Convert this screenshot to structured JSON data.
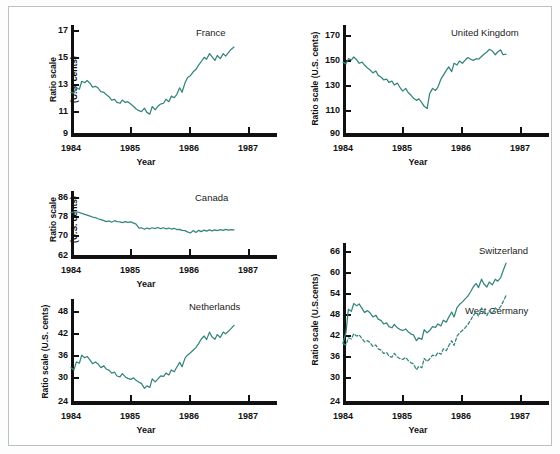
{
  "figure": {
    "background": "#ffffff",
    "line_color": "#35847c",
    "axis_color": "#111111"
  },
  "charts": [
    {
      "id": "france",
      "type": "line",
      "title": "France",
      "ylabel_line1": "Ratio scale",
      "ylabel_line2": "(U.S. cents)",
      "ylabel": "Ratio scale (U.S. cents)",
      "xlabel": "Year",
      "yticks": [
        "17",
        "15",
        "13",
        "11",
        "9"
      ],
      "ytick_values": [
        17,
        15,
        13,
        11,
        9
      ],
      "xticks": [
        "1984",
        "1985",
        "1986",
        "1987"
      ],
      "xtick_values": [
        1984,
        1985,
        1986,
        1987
      ],
      "ylim": [
        9,
        17
      ],
      "xlim": [
        1984,
        1987.45
      ],
      "scale": "log",
      "series": [
        {
          "name": "France",
          "style": "solid",
          "x": [
            1984.0,
            1984.05,
            1984.09,
            1984.14,
            1984.18,
            1984.23,
            1984.27,
            1984.32,
            1984.36,
            1984.41,
            1984.45,
            1984.5,
            1984.55,
            1984.59,
            1984.64,
            1984.68,
            1984.73,
            1984.77,
            1984.82,
            1984.86,
            1984.91,
            1984.95,
            1985.0,
            1985.05,
            1985.09,
            1985.14,
            1985.18,
            1985.23,
            1985.27,
            1985.32,
            1985.36,
            1985.41,
            1985.45,
            1985.5,
            1985.55,
            1985.59,
            1985.64,
            1985.68,
            1985.73,
            1985.77,
            1985.82,
            1985.86,
            1985.91,
            1985.95,
            1986.0,
            1986.05,
            1986.09,
            1986.14,
            1986.18,
            1986.23,
            1986.27,
            1986.32,
            1986.36,
            1986.41,
            1986.45,
            1986.5,
            1986.55,
            1986.59,
            1986.64,
            1986.68,
            1986.73
          ],
          "y": [
            11.6,
            11.55,
            11.9,
            11.8,
            12.35,
            12.25,
            12.4,
            12.2,
            11.95,
            12.0,
            11.9,
            11.65,
            11.6,
            11.45,
            11.3,
            11.1,
            11.15,
            10.95,
            10.9,
            11.1,
            10.95,
            11.0,
            10.85,
            10.7,
            10.55,
            10.45,
            10.4,
            10.6,
            10.35,
            10.25,
            10.7,
            10.5,
            10.7,
            10.85,
            10.9,
            11.15,
            11.0,
            11.35,
            11.25,
            11.45,
            11.9,
            11.6,
            12.25,
            12.6,
            12.75,
            13.05,
            13.2,
            13.55,
            13.8,
            14.15,
            14.0,
            14.45,
            14.2,
            13.9,
            14.3,
            14.05,
            14.45,
            14.25,
            14.55,
            14.8,
            15.0
          ]
        }
      ]
    },
    {
      "id": "united-kingdom",
      "type": "line",
      "title": "United Kingdom",
      "ylabel": "Ratio scale (U.S. cents)",
      "xlabel": "Year",
      "yticks": [
        "170",
        "150",
        "130",
        "110",
        "90"
      ],
      "ytick_values": [
        170,
        150,
        130,
        110,
        90
      ],
      "xticks": [
        "1984",
        "1985",
        "1986",
        "1987"
      ],
      "xtick_values": [
        1984,
        1985,
        1986,
        1987
      ],
      "ylim": [
        90,
        178
      ],
      "xlim": [
        1984,
        1987.45
      ],
      "scale": "log",
      "series": [
        {
          "name": "United Kingdom",
          "style": "solid",
          "x": [
            1984.0,
            1984.05,
            1984.09,
            1984.14,
            1984.18,
            1984.23,
            1984.27,
            1984.32,
            1984.36,
            1984.41,
            1984.45,
            1984.5,
            1984.55,
            1984.59,
            1984.64,
            1984.68,
            1984.73,
            1984.77,
            1984.82,
            1984.86,
            1984.91,
            1984.95,
            1985.0,
            1985.05,
            1985.09,
            1985.14,
            1985.18,
            1985.23,
            1985.27,
            1985.32,
            1985.36,
            1985.41,
            1985.45,
            1985.5,
            1985.55,
            1985.59,
            1985.64,
            1985.68,
            1985.73,
            1985.77,
            1985.82,
            1985.86,
            1985.91,
            1985.95,
            1986.0,
            1986.05,
            1986.09,
            1986.14,
            1986.18,
            1986.23,
            1986.27,
            1986.32,
            1986.36,
            1986.41,
            1986.45,
            1986.5,
            1986.55,
            1986.59,
            1986.64,
            1986.68,
            1986.73
          ],
          "y": [
            142.0,
            140.5,
            145.0,
            144.0,
            146.5,
            144.0,
            141.0,
            142.0,
            139.5,
            137.0,
            135.5,
            133.0,
            134.5,
            131.0,
            129.5,
            127.5,
            128.0,
            125.5,
            126.5,
            123.5,
            125.0,
            122.0,
            119.0,
            121.0,
            118.0,
            116.0,
            114.0,
            112.5,
            113.5,
            111.0,
            108.5,
            107.0,
            117.0,
            121.0,
            119.5,
            122.0,
            128.0,
            131.0,
            135.0,
            138.0,
            134.0,
            141.0,
            139.5,
            143.0,
            141.0,
            144.0,
            146.0,
            144.5,
            143.5,
            145.0,
            144.5,
            147.0,
            149.0,
            151.0,
            153.5,
            152.0,
            148.5,
            151.0,
            153.0,
            148.5,
            149.0
          ]
        }
      ]
    },
    {
      "id": "canada",
      "type": "line",
      "title": "Canada",
      "ylabel_line1": "Ratio scale",
      "ylabel_line2": "(U.S. cents)",
      "ylabel": "Ratio scale (U.S. cents)",
      "xlabel": "Year",
      "yticks": [
        "86",
        "78",
        "70",
        "62"
      ],
      "ytick_values": [
        86,
        78,
        70,
        62
      ],
      "xticks": [
        "1984",
        "1985",
        "1986",
        "1987"
      ],
      "xtick_values": [
        1984,
        1985,
        1986,
        1987
      ],
      "ylim": [
        62,
        89
      ],
      "xlim": [
        1984,
        1987.45
      ],
      "scale": "log",
      "series": [
        {
          "name": "Canada",
          "style": "solid",
          "x": [
            1984.0,
            1984.05,
            1984.09,
            1984.14,
            1984.18,
            1984.23,
            1984.27,
            1984.32,
            1984.36,
            1984.41,
            1984.45,
            1984.5,
            1984.55,
            1984.59,
            1984.64,
            1984.68,
            1984.73,
            1984.77,
            1984.82,
            1984.86,
            1984.91,
            1984.95,
            1985.0,
            1985.05,
            1985.09,
            1985.14,
            1985.18,
            1985.23,
            1985.27,
            1985.32,
            1985.36,
            1985.41,
            1985.45,
            1985.5,
            1985.55,
            1985.59,
            1985.64,
            1985.68,
            1985.73,
            1985.77,
            1985.82,
            1985.86,
            1985.91,
            1985.95,
            1986.0,
            1986.05,
            1986.09,
            1986.14,
            1986.18,
            1986.23,
            1986.27,
            1986.32,
            1986.36,
            1986.41,
            1986.45,
            1986.5,
            1986.55,
            1986.59,
            1986.64,
            1986.68,
            1986.73
          ],
          "y": [
            79.3,
            79.6,
            79.6,
            79.4,
            79.0,
            78.6,
            78.3,
            77.9,
            77.5,
            77.3,
            76.8,
            76.4,
            76.0,
            75.6,
            75.9,
            75.4,
            76.0,
            75.6,
            75.5,
            75.2,
            75.6,
            75.3,
            75.5,
            75.0,
            74.6,
            73.1,
            73.2,
            72.6,
            73.1,
            72.8,
            73.2,
            72.9,
            73.3,
            72.9,
            73.2,
            72.8,
            73.1,
            72.7,
            73.0,
            72.5,
            72.6,
            72.2,
            72.1,
            71.6,
            71.2,
            72.1,
            71.4,
            72.2,
            71.7,
            72.3,
            71.9,
            72.4,
            72.0,
            72.4,
            72.1,
            72.5,
            72.2,
            72.6,
            72.3,
            72.5,
            72.4
          ]
        }
      ]
    },
    {
      "id": "netherlands",
      "type": "line",
      "title": "Netherlands",
      "ylabel": "Ratio scale (U.S. cents)",
      "xlabel": "Year",
      "yticks": [
        "48",
        "42",
        "36",
        "30",
        "24"
      ],
      "ytick_values": [
        48,
        42,
        36,
        30,
        24
      ],
      "xticks": [
        "1984",
        "1985",
        "1986",
        "1987"
      ],
      "xtick_values": [
        1984,
        1985,
        1986,
        1987
      ],
      "ylim": [
        24,
        51
      ],
      "xlim": [
        1984,
        1987.45
      ],
      "scale": "log",
      "series": [
        {
          "name": "Netherlands",
          "style": "solid",
          "x": [
            1984.0,
            1984.05,
            1984.09,
            1984.14,
            1984.18,
            1984.23,
            1984.27,
            1984.32,
            1984.36,
            1984.41,
            1984.45,
            1984.5,
            1984.55,
            1984.59,
            1984.64,
            1984.68,
            1984.73,
            1984.77,
            1984.82,
            1984.86,
            1984.91,
            1984.95,
            1985.0,
            1985.05,
            1985.09,
            1985.14,
            1985.18,
            1985.23,
            1985.27,
            1985.32,
            1985.36,
            1985.41,
            1985.45,
            1985.5,
            1985.55,
            1985.59,
            1985.64,
            1985.68,
            1985.73,
            1985.77,
            1985.82,
            1985.86,
            1985.91,
            1985.95,
            1986.0,
            1986.05,
            1986.09,
            1986.14,
            1986.18,
            1986.23,
            1986.27,
            1986.32,
            1986.36,
            1986.41,
            1986.45,
            1986.5,
            1986.55,
            1986.59,
            1986.64,
            1986.68,
            1986.73
          ],
          "y": [
            31.3,
            30.8,
            32.6,
            32.3,
            34.2,
            33.6,
            33.9,
            33.0,
            32.2,
            32.6,
            32.2,
            31.3,
            31.7,
            31.0,
            30.7,
            30.1,
            30.3,
            29.5,
            29.3,
            30.0,
            29.3,
            29.0,
            28.8,
            29.1,
            28.6,
            28.2,
            28.0,
            27.0,
            27.5,
            27.2,
            28.9,
            28.3,
            28.8,
            29.5,
            29.4,
            30.1,
            29.7,
            30.8,
            30.4,
            31.4,
            32.5,
            31.5,
            33.5,
            34.2,
            34.8,
            35.5,
            36.1,
            37.2,
            38.3,
            39.2,
            38.2,
            40.3,
            39.0,
            38.3,
            39.6,
            38.8,
            40.3,
            39.8,
            40.6,
            41.3,
            42.3
          ]
        }
      ]
    },
    {
      "id": "switzerland-west-germany",
      "type": "line",
      "title": "Switzerland / West Germany",
      "ylabel": "Ratio scale (U.S.cents)",
      "xlabel": "Year",
      "yticks": [
        "66",
        "60",
        "54",
        "48",
        "42",
        "36",
        "30",
        "24"
      ],
      "ytick_values": [
        66,
        60,
        54,
        48,
        42,
        36,
        30,
        24
      ],
      "xticks": [
        "1984",
        "1985",
        "1986",
        "1987"
      ],
      "xtick_values": [
        1984,
        1985,
        1986,
        1987
      ],
      "ylim": [
        24,
        69
      ],
      "xlim": [
        1984,
        1987.45
      ],
      "scale": "log",
      "legend": [
        "Switzerland",
        "West Germany"
      ],
      "series": [
        {
          "name": "Switzerland",
          "style": "solid",
          "x": [
            1984.0,
            1984.05,
            1984.09,
            1984.14,
            1984.18,
            1984.23,
            1984.27,
            1984.32,
            1984.36,
            1984.41,
            1984.45,
            1984.5,
            1984.55,
            1984.59,
            1984.64,
            1984.68,
            1984.73,
            1984.77,
            1984.82,
            1984.86,
            1984.91,
            1984.95,
            1985.0,
            1985.05,
            1985.09,
            1985.14,
            1985.18,
            1985.23,
            1985.27,
            1985.32,
            1985.36,
            1985.41,
            1985.45,
            1985.5,
            1985.55,
            1985.59,
            1985.64,
            1985.68,
            1985.73,
            1985.77,
            1985.82,
            1985.86,
            1985.91,
            1985.95,
            1986.0,
            1986.05,
            1986.09,
            1986.14,
            1986.18,
            1986.23,
            1986.27,
            1986.32,
            1986.36,
            1986.41,
            1986.45,
            1986.5,
            1986.55,
            1986.59,
            1986.64,
            1986.68,
            1986.73
          ],
          "y": [
            36.0,
            38.5,
            44.8,
            44.2,
            46.5,
            45.8,
            46.4,
            45.0,
            43.9,
            44.4,
            43.8,
            42.6,
            43.1,
            42.0,
            41.6,
            40.7,
            41.0,
            40.0,
            39.7,
            40.6,
            39.7,
            39.3,
            39.0,
            39.4,
            38.7,
            38.1,
            37.9,
            36.5,
            37.2,
            36.8,
            39.2,
            38.4,
            39.0,
            40.0,
            39.8,
            40.7,
            40.2,
            41.7,
            41.2,
            42.5,
            44.0,
            42.6,
            45.3,
            46.2,
            47.0,
            48.0,
            48.8,
            50.3,
            51.8,
            53.0,
            51.6,
            54.5,
            52.8,
            51.8,
            53.5,
            52.5,
            54.5,
            53.8,
            55.0,
            57.5,
            60.5
          ]
        },
        {
          "name": "West Germany",
          "style": "dashed",
          "x": [
            1984.0,
            1984.05,
            1984.09,
            1984.14,
            1984.18,
            1984.23,
            1984.27,
            1984.32,
            1984.36,
            1984.41,
            1984.45,
            1984.5,
            1984.55,
            1984.59,
            1984.64,
            1984.68,
            1984.73,
            1984.77,
            1984.82,
            1984.86,
            1984.91,
            1984.95,
            1985.0,
            1985.05,
            1985.09,
            1985.14,
            1985.18,
            1985.23,
            1985.27,
            1985.32,
            1985.36,
            1985.41,
            1985.45,
            1985.5,
            1985.55,
            1985.59,
            1985.64,
            1985.68,
            1985.73,
            1985.77,
            1985.82,
            1985.86,
            1985.91,
            1985.95,
            1986.0,
            1986.05,
            1986.09,
            1986.14,
            1986.18,
            1986.23,
            1986.27,
            1986.32,
            1986.36,
            1986.41,
            1986.45,
            1986.5,
            1986.55,
            1986.59,
            1986.64,
            1986.68,
            1986.73
          ],
          "y": [
            35.8,
            35.5,
            37.2,
            36.9,
            38.2,
            37.6,
            37.9,
            37.0,
            36.2,
            36.5,
            36.1,
            35.2,
            35.5,
            34.6,
            34.3,
            33.6,
            33.8,
            33.0,
            32.8,
            33.6,
            32.8,
            32.5,
            32.3,
            32.7,
            32.1,
            31.6,
            31.4,
            30.2,
            30.9,
            30.6,
            32.5,
            31.9,
            32.4,
            33.2,
            33.0,
            33.8,
            33.4,
            34.6,
            34.2,
            35.3,
            36.5,
            35.4,
            37.6,
            38.4,
            39.0,
            39.8,
            40.5,
            41.8,
            43.0,
            44.0,
            42.8,
            45.2,
            43.8,
            43.0,
            44.4,
            43.6,
            45.2,
            44.6,
            45.6,
            47.0,
            49.0
          ]
        }
      ]
    }
  ]
}
